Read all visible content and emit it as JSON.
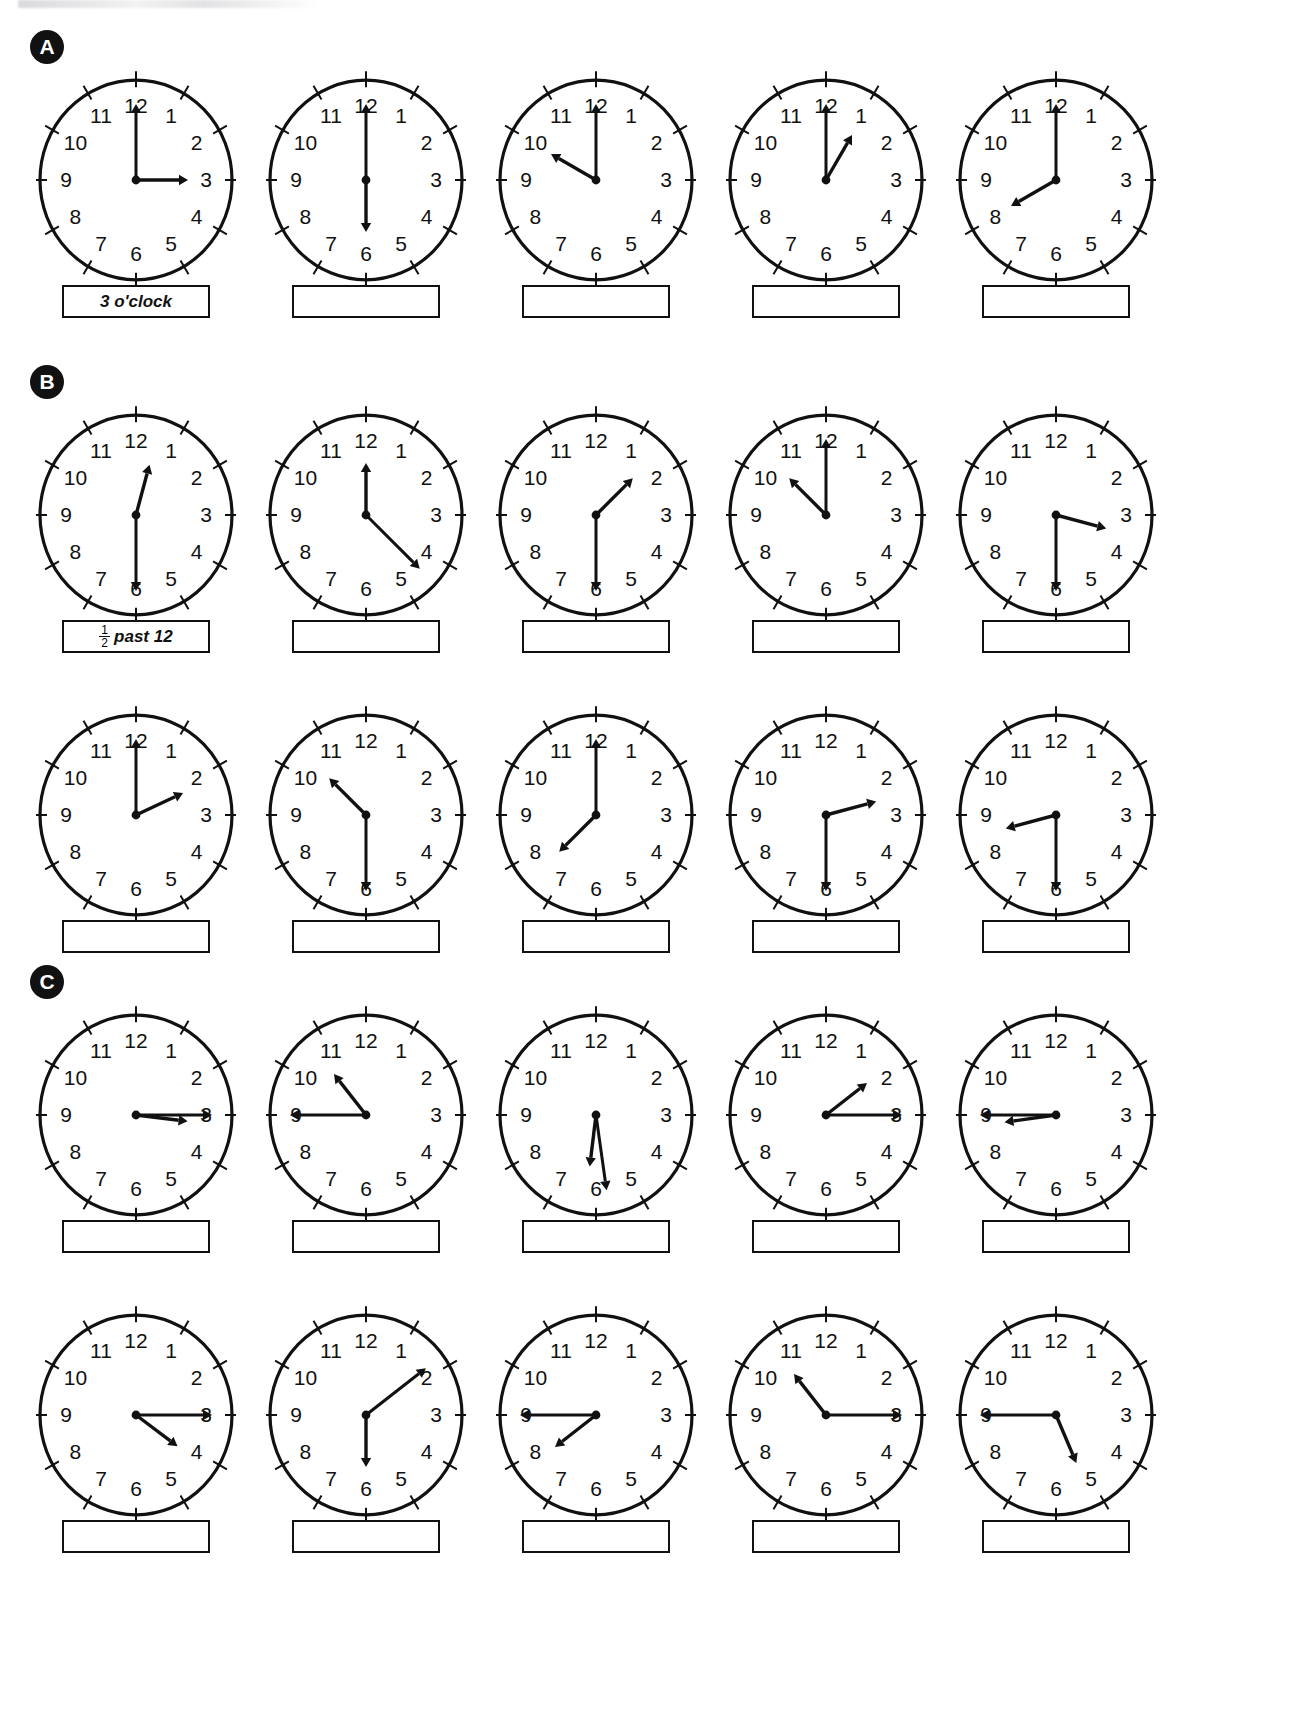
{
  "worksheet": {
    "title": "Telling the time worksheet",
    "sections": [
      {
        "id": "A",
        "badge": "A",
        "rows": [
          {
            "clocks": [
              {
                "name": "clock-a1",
                "hour_angle": 90,
                "minute_angle": 0,
                "time": "3 o'clock",
                "answer": "3 o'clock",
                "answer_type": "text"
              },
              {
                "name": "clock-a2",
                "hour_angle": 180,
                "minute_angle": 0,
                "time": "6 o'clock",
                "answer": "",
                "answer_type": "blank"
              },
              {
                "name": "clock-a3",
                "hour_angle": 300,
                "minute_angle": 0,
                "time": "10 o'clock",
                "answer": "",
                "answer_type": "blank"
              },
              {
                "name": "clock-a4",
                "hour_angle": 30,
                "minute_angle": 0,
                "time": "1 o'clock",
                "answer": "",
                "answer_type": "blank"
              },
              {
                "name": "clock-a5",
                "hour_angle": 240,
                "minute_angle": 0,
                "time": "8 o'clock",
                "answer": "",
                "answer_type": "blank"
              }
            ]
          }
        ]
      },
      {
        "id": "B",
        "badge": "B",
        "rows": [
          {
            "clocks": [
              {
                "name": "clock-b1",
                "hour_angle": 15,
                "minute_angle": 180,
                "time": "half past 12",
                "answer": "past 12",
                "answer_type": "fraction"
              },
              {
                "name": "clock-b2",
                "hour_angle": 0,
                "minute_angle": 135,
                "time": "half past 12",
                "answer": "",
                "answer_type": "blank"
              },
              {
                "name": "clock-b3",
                "hour_angle": 45,
                "minute_angle": 180,
                "time": "half past 1",
                "answer": "",
                "answer_type": "blank"
              },
              {
                "name": "clock-b4",
                "hour_angle": 315,
                "minute_angle": 0,
                "time": "half past 10",
                "answer": "",
                "answer_type": "blank"
              },
              {
                "name": "clock-b5",
                "hour_angle": 105,
                "minute_angle": 180,
                "time": "half past 3",
                "answer": "",
                "answer_type": "blank"
              }
            ]
          },
          {
            "clocks": [
              {
                "name": "clock-b6",
                "hour_angle": 65,
                "minute_angle": 0,
                "time": "half past 2",
                "answer": "",
                "answer_type": "blank"
              },
              {
                "name": "clock-b7",
                "hour_angle": 315,
                "minute_angle": 180,
                "time": "half past 10",
                "answer": "",
                "answer_type": "blank"
              },
              {
                "name": "clock-b8",
                "hour_angle": 225,
                "minute_angle": 0,
                "time": "half past 7",
                "answer": "",
                "answer_type": "blank"
              },
              {
                "name": "clock-b9",
                "hour_angle": 75,
                "minute_angle": 180,
                "time": "half past 2",
                "answer": "",
                "answer_type": "blank"
              },
              {
                "name": "clock-b10",
                "hour_angle": 255,
                "minute_angle": 180,
                "time": "half past 8",
                "answer": "",
                "answer_type": "blank"
              }
            ]
          }
        ]
      },
      {
        "id": "C",
        "badge": "C",
        "rows": [
          {
            "clocks": [
              {
                "name": "clock-c1",
                "hour_angle": 97,
                "minute_angle": 90,
                "time": "quarter past 3",
                "answer": "",
                "answer_type": "blank"
              },
              {
                "name": "clock-c2",
                "hour_angle": 322,
                "minute_angle": 270,
                "time": "quarter to 11",
                "answer": "",
                "answer_type": "blank"
              },
              {
                "name": "clock-c3",
                "hour_angle": 187,
                "minute_angle": 172,
                "time": "half past 6",
                "answer": "",
                "answer_type": "blank"
              },
              {
                "name": "clock-c4",
                "hour_angle": 52,
                "minute_angle": 90,
                "time": "quarter past 1",
                "answer": "",
                "answer_type": "blank"
              },
              {
                "name": "clock-c5",
                "hour_angle": 262,
                "minute_angle": 270,
                "time": "quarter to 9",
                "answer": "",
                "answer_type": "blank"
              }
            ]
          },
          {
            "clocks": [
              {
                "name": "clock-c6",
                "hour_angle": 127,
                "minute_angle": 90,
                "time": "quarter past 4",
                "answer": "",
                "answer_type": "blank"
              },
              {
                "name": "clock-c7",
                "hour_angle": 180,
                "minute_angle": 52,
                "time": "ten past 6",
                "answer": "",
                "answer_type": "blank"
              },
              {
                "name": "clock-c8",
                "hour_angle": 232,
                "minute_angle": 270,
                "time": "quarter to 8",
                "answer": "",
                "answer_type": "blank"
              },
              {
                "name": "clock-c9",
                "hour_angle": 322,
                "minute_angle": 90,
                "time": "quarter past 10",
                "answer": "",
                "answer_type": "blank"
              },
              {
                "name": "clock-c10",
                "hour_angle": 157,
                "minute_angle": 270,
                "time": "quarter to 5",
                "answer": "",
                "answer_type": "blank"
              }
            ]
          }
        ]
      }
    ],
    "clock_numerals": [
      "12",
      "1",
      "2",
      "3",
      "4",
      "5",
      "6",
      "7",
      "8",
      "9",
      "10",
      "11"
    ],
    "sample_answers": {
      "a1": "3 o'clock",
      "b1_numerator": "1",
      "b1_denominator": "2",
      "b1_text": "past 12"
    },
    "colors": {
      "ink": "#111111",
      "badge_bg": "#111111",
      "badge_fg": "#ffffff",
      "page_bg": "#ffffff"
    }
  }
}
